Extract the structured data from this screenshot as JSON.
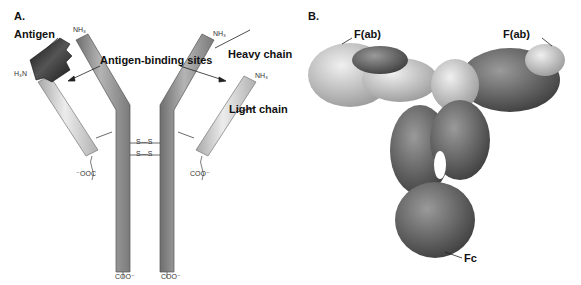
{
  "panel_a": {
    "letter": "A.",
    "labels": {
      "antigen": "Antigen",
      "antigen_binding_sites": "Antigen-binding sites",
      "heavy_chain": "Heavy chain",
      "light_chain": "Light chain"
    },
    "chem": {
      "nh3_left": "H₃N",
      "nh3_heavy_left": "NH₃",
      "nh3_heavy_right": "NH₃",
      "nh3_light_right": "NH₃",
      "plus": "+",
      "coo_light_left": "⁻OOC",
      "coo_light_right": "COO⁻",
      "coo_heavy_left": "COO⁻",
      "coo_heavy_right": "COO⁻",
      "disulfide": "S—S"
    },
    "colors": {
      "heavy_chain": "#8a8a8a",
      "light_chain": "#c8c8c8",
      "antigen": "#2a2a2a"
    }
  },
  "panel_b": {
    "letter": "B.",
    "labels": {
      "fab_left": "F(ab)",
      "fab_right": "F(ab)",
      "fc": "Fc"
    },
    "colors": {
      "light_region": "#d6d6d6",
      "dark_region": "#707070"
    }
  }
}
